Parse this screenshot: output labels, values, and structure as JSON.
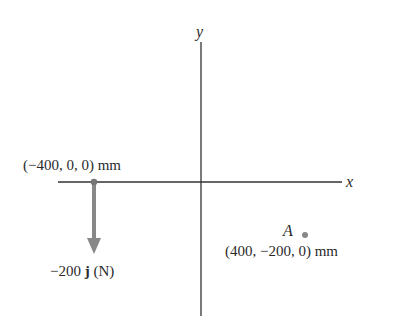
{
  "axes": {
    "x_label": "x",
    "y_label": "y"
  },
  "point_force": {
    "coords_label": "(−400, 0, 0) mm",
    "force_value": "−200",
    "force_unit_vector": "j",
    "force_units": "(N)"
  },
  "point_a": {
    "name": "A",
    "coords_label": "(400, −200, 0) mm"
  },
  "colors": {
    "axis": "#333333",
    "arrow": "#888888",
    "point": "#777777"
  }
}
